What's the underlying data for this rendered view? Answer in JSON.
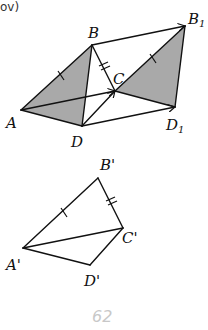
{
  "header_fragment": "ov)",
  "figure_top": {
    "points": {
      "A": "A",
      "B": "B",
      "C": "C",
      "D": "D",
      "B1": "B",
      "B1_sub": "1",
      "D1": "D",
      "D1_sub": "1"
    }
  },
  "figure_bottom": {
    "points": {
      "A_prime": "A'",
      "B_prime": "B'",
      "C_prime": "C'",
      "D_prime": "D'"
    }
  },
  "page_number": "62"
}
